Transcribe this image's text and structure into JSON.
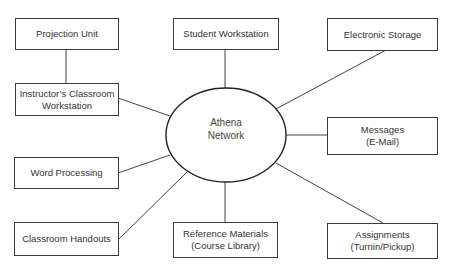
{
  "hub": {
    "line1": "Athena",
    "line2": "Network"
  },
  "nodes": {
    "projection_unit": {
      "line1": "Projection Unit"
    },
    "instructor_workstation": {
      "line1": "Instructor’s Classroom",
      "line2": "Workstation"
    },
    "student_workstation": {
      "line1": "Student Workstation"
    },
    "electronic_storage": {
      "line1": "Electronic Storage"
    },
    "messages": {
      "line1": "Messages",
      "line2": "(E-Mail)"
    },
    "word_processing": {
      "line1": "Word Processing"
    },
    "classroom_handouts": {
      "line1": "Classroom Handouts"
    },
    "reference_materials": {
      "line1": "Reference Materials",
      "line2": "(Course Library)"
    },
    "assignments": {
      "line1": "Assignments",
      "line2": "(Turnin/Pickup)"
    }
  },
  "edges": [
    [
      "projection_unit",
      "instructor_workstation"
    ],
    [
      "instructor_workstation",
      "hub"
    ],
    [
      "student_workstation",
      "hub"
    ],
    [
      "electronic_storage",
      "hub"
    ],
    [
      "messages",
      "hub"
    ],
    [
      "word_processing",
      "hub"
    ],
    [
      "classroom_handouts",
      "hub"
    ],
    [
      "reference_materials",
      "hub"
    ],
    [
      "assignments",
      "hub"
    ]
  ]
}
